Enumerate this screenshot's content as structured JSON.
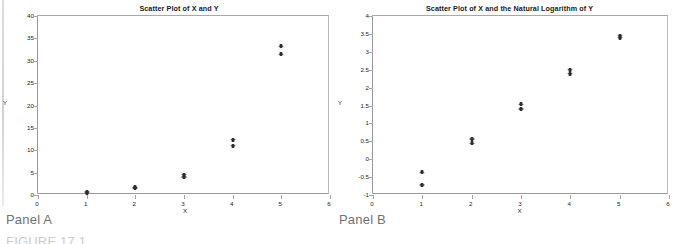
{
  "document": {
    "figure_caption": "FIGURE 17.1"
  },
  "panels": [
    {
      "caption": "Panel A",
      "chart_data": {
        "type": "scatter",
        "title": "Scatter Plot of X and Y",
        "xlabel": "X",
        "ylabel": "Y",
        "xlim": [
          0,
          6
        ],
        "ylim": [
          0,
          40
        ],
        "xticks": [
          0,
          1,
          2,
          3,
          4,
          5,
          6
        ],
        "xtick_labels": [
          "0",
          "1",
          "2",
          "3",
          "4",
          "5",
          "6"
        ],
        "yticks": [
          0,
          5,
          10,
          15,
          20,
          25,
          30,
          35,
          40
        ],
        "ytick_labels": [
          "0",
          "5",
          "10",
          "15",
          "20",
          "25",
          "30",
          "35",
          "40"
        ],
        "grid": false,
        "legend": null,
        "marker": "diamond",
        "points": [
          {
            "x": 1,
            "y": 0.7
          },
          {
            "x": 1,
            "y": 0.5
          },
          {
            "x": 2,
            "y": 1.7
          },
          {
            "x": 2,
            "y": 1.5
          },
          {
            "x": 3,
            "y": 4.5
          },
          {
            "x": 3,
            "y": 4.0
          },
          {
            "x": 4,
            "y": 12.4
          },
          {
            "x": 4,
            "y": 11.0
          },
          {
            "x": 5,
            "y": 33.2
          },
          {
            "x": 5,
            "y": 31.4
          }
        ]
      }
    },
    {
      "caption": "Panel B",
      "chart_data": {
        "type": "scatter",
        "title": "Scatter Plot of X and the Natural Logarithm of Y",
        "xlabel": "X",
        "ylabel": "Y",
        "xlim": [
          0,
          6
        ],
        "ylim": [
          -1,
          4
        ],
        "xticks": [
          0,
          1,
          2,
          3,
          4,
          5,
          6
        ],
        "xtick_labels": [
          "0",
          "1",
          "2",
          "3",
          "4",
          "5",
          "6"
        ],
        "yticks": [
          -1,
          -0.5,
          0,
          0.5,
          1,
          1.5,
          2,
          2.5,
          3,
          3.5,
          4
        ],
        "ytick_labels": [
          "-1",
          "-0.5",
          "0",
          "0.5",
          "1",
          "1.5",
          "2",
          "2.5",
          "3",
          "3.5",
          "4"
        ],
        "grid": false,
        "legend": null,
        "marker": "diamond",
        "points": [
          {
            "x": 1,
            "y": -0.37
          },
          {
            "x": 1,
            "y": -0.72
          },
          {
            "x": 2,
            "y": 0.56
          },
          {
            "x": 2,
            "y": 0.44
          },
          {
            "x": 3,
            "y": 1.53
          },
          {
            "x": 3,
            "y": 1.4
          },
          {
            "x": 4,
            "y": 2.5
          },
          {
            "x": 4,
            "y": 2.39
          },
          {
            "x": 5,
            "y": 3.45
          },
          {
            "x": 5,
            "y": 3.39
          }
        ]
      }
    }
  ]
}
